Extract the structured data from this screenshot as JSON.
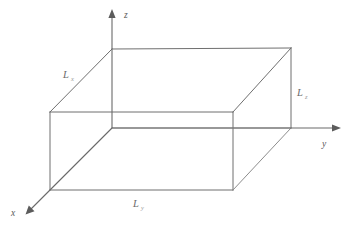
{
  "figure": {
    "background_color": "#ffffff",
    "line_color": "#6f6f6f",
    "label_color": "#6a6a6a"
  },
  "axes": [
    {
      "id": "z",
      "label": "z",
      "direction": "up",
      "label_x": 124,
      "label_y": 17,
      "arrow_tip_x": 112,
      "arrow_tip_y": 12,
      "tail_x": 112,
      "tail_y": 128
    },
    {
      "id": "y",
      "label": "y",
      "direction": "right",
      "label_x": 325,
      "label_y": 145,
      "arrow_tip_x": 338,
      "arrow_tip_y": 128,
      "tail_x": 112,
      "tail_y": 128
    },
    {
      "id": "x",
      "label": "x",
      "direction": "down-left",
      "label_x": 12,
      "label_y": 215,
      "arrow_tip_x": 26,
      "arrow_tip_y": 212,
      "tail_x": 112,
      "tail_y": 128
    }
  ],
  "dimension_labels": [
    {
      "id": "Lx",
      "base": "L",
      "subscript": "x",
      "x": 64,
      "y": 76,
      "edge": "back-top-left-to-origin-top"
    },
    {
      "id": "Lz",
      "base": "L",
      "subscript": "z",
      "x": 297,
      "y": 95,
      "edge": "right-back-vertical"
    },
    {
      "id": "Ly",
      "base": "L",
      "subscript": "y",
      "x": 134,
      "y": 205,
      "edge": "front-bottom-horizontal"
    }
  ],
  "box": {
    "type": "cuboid",
    "vertices": {
      "front_bottom_left": [
        50,
        190
      ],
      "front_bottom_right": [
        233,
        190
      ],
      "front_top_left": [
        50,
        112
      ],
      "front_top_right": [
        233,
        112
      ],
      "back_bottom_left": [
        112,
        128
      ],
      "back_bottom_right": [
        291,
        128
      ],
      "back_top_left": [
        112,
        49
      ],
      "back_top_right": [
        291,
        48
      ]
    },
    "edges": [
      [
        "front_bottom_left",
        "front_bottom_right"
      ],
      [
        "front_bottom_left",
        "front_top_left"
      ],
      [
        "front_top_left",
        "front_top_right"
      ],
      [
        "front_bottom_right",
        "front_top_right"
      ],
      [
        "back_bottom_left",
        "back_bottom_right"
      ],
      [
        "back_top_left",
        "back_top_right"
      ],
      [
        "back_bottom_right",
        "back_top_right"
      ],
      [
        "front_top_left",
        "back_top_left"
      ],
      [
        "front_top_right",
        "back_top_right"
      ],
      [
        "front_bottom_left",
        "back_bottom_left"
      ],
      [
        "front_bottom_right",
        "back_bottom_right"
      ],
      [
        "back_bottom_left",
        "back_top_left"
      ]
    ]
  }
}
